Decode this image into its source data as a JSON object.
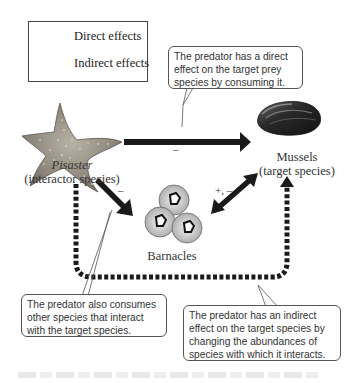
{
  "legend": {
    "direct_label": "Direct effects",
    "indirect_label": "Indirect effects"
  },
  "species": {
    "pisaster": {
      "name": "Pisaster",
      "role": "(interactor species)"
    },
    "mussels": {
      "name": "Mussels",
      "role": "(target species)"
    },
    "barnacles": {
      "name": "Barnacles"
    }
  },
  "signs": {
    "pisaster_to_mussels": "–",
    "pisaster_to_barnacles": "–",
    "barnacles_mussels": "+, –"
  },
  "callouts": {
    "direct_effect": "The predator has a direct effect on the target prey species by consuming it.",
    "also_consumes": "The predator also consumes other species that interact with the target species.",
    "indirect_effect": "The predator has an indirect effect on the target species by changing the abundances of species with which it interacts."
  },
  "colors": {
    "arrow": "#1a1a1a",
    "callout_border": "#555555",
    "text": "#333333"
  }
}
